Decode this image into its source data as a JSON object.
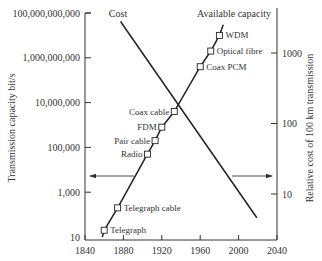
{
  "chart_data": {
    "type": "line",
    "title": "",
    "xlabel": "",
    "ylabel": "Transmission capacity bit/s",
    "y2label": "Relative cost of 100 km transmission",
    "xlim": [
      1840,
      2040
    ],
    "ylim": [
      10,
      100000000000
    ],
    "y2lim": [
      3,
      4000
    ],
    "yscale": "log",
    "y2scale": "log",
    "grid": false,
    "x_ticks": [
      1840,
      1880,
      1920,
      1960,
      2000,
      2040
    ],
    "x_tick_labels": [
      "1840",
      "1880",
      "1920",
      "1960",
      "2000",
      "2040"
    ],
    "y_ticks": [
      10,
      1000,
      100000,
      10000000,
      1000000000,
      100000000000
    ],
    "y_tick_labels": [
      "10",
      "1,000",
      "100,000",
      "10,000,000",
      "1,000,000,000",
      "100,000,000,000"
    ],
    "y2_ticks": [
      10,
      100,
      1000
    ],
    "y2_tick_labels": [
      "10",
      "100",
      "1000"
    ],
    "series": [
      {
        "name": "Available capacity",
        "axis": "left",
        "marker": "square",
        "points": [
          {
            "label": "Telegraph",
            "x": 1860,
            "y": 20
          },
          {
            "label": "Telegraph cable",
            "x": 1874,
            "y": 200
          },
          {
            "label": "Radio",
            "x": 1905,
            "y": 50000
          },
          {
            "label": "Pair cable",
            "x": 1913,
            "y": 200000
          },
          {
            "label": "FDM",
            "x": 1920,
            "y": 800000
          },
          {
            "label": "Coax cable",
            "x": 1933,
            "y": 4000000
          },
          {
            "label": "Coax PCM",
            "x": 1960,
            "y": 400000000
          },
          {
            "label": "Optical fibre",
            "x": 1971,
            "y": 2000000000
          },
          {
            "label": "WDM",
            "x": 1980,
            "y": 10000000000
          }
        ],
        "line_start": {
          "x": 1858,
          "y": 10
        },
        "line_end": {
          "x": 1984,
          "y": 30000000000
        }
      },
      {
        "name": "Cost",
        "axis": "right",
        "marker": "none",
        "points": [
          {
            "x": 1877,
            "y": 2800
          },
          {
            "x": 2019,
            "y": 4.6
          }
        ]
      }
    ],
    "annotations": [
      {
        "type": "arrow",
        "direction": "left",
        "meaning": "Available capacity uses left axis"
      },
      {
        "type": "arrow",
        "direction": "right",
        "meaning": "Cost uses right axis"
      }
    ]
  },
  "labels": {
    "cost": "Cost",
    "available_capacity": "Available capacity",
    "y_left": "Transmission capacity bit/s",
    "y_right": "Relative cost of 100 km transmission"
  }
}
